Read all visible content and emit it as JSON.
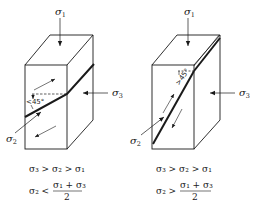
{
  "figure": {
    "colors": {
      "ink": "#1a1a1a",
      "background": "#ffffff"
    },
    "panels": [
      {
        "id": "left",
        "labels": {
          "sigma1": {
            "symbol": "σ",
            "subscript": "1"
          },
          "sigma2": {
            "symbol": "σ",
            "subscript": "2"
          },
          "sigma3": {
            "symbol": "σ",
            "subscript": "3"
          }
        },
        "angle_label": "< 45°",
        "angle_text": "45°",
        "angle_prefix": "<",
        "relation_line1": "σ₃ > σ₂ > σ₁",
        "relation_line2_lhs": "σ₂ <",
        "relation_line2_num": "σ₁ + σ₃",
        "relation_line2_den": "2"
      },
      {
        "id": "right",
        "labels": {
          "sigma1": {
            "symbol": "σ",
            "subscript": "1"
          },
          "sigma2": {
            "symbol": "σ",
            "subscript": "2"
          },
          "sigma3": {
            "symbol": "σ",
            "subscript": "3"
          }
        },
        "angle_label": "> 45°",
        "angle_text": "45°",
        "angle_prefix": ">",
        "relation_line1": "σ₃ > σ₂ > σ₁",
        "relation_line2_lhs": "σ₂ >",
        "relation_line2_num": "σ₁ + σ₃",
        "relation_line2_den": "2"
      }
    ]
  }
}
